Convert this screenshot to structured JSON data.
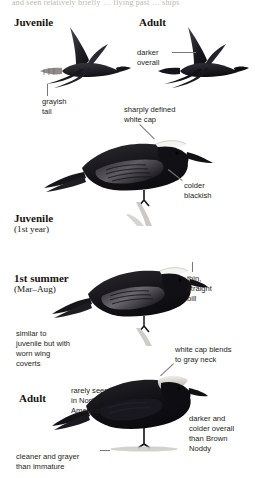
{
  "page": {
    "width": 255,
    "height": 478,
    "background": "#ffffff",
    "running_head_fragment": "and seen relatively briefly … flying past … ships"
  },
  "plate_labels": [
    {
      "id": "juvenile-flight",
      "text": "Juvenile",
      "sub": "",
      "x": 14,
      "y": 16,
      "size": 11
    },
    {
      "id": "adult-flight",
      "text": "Adult",
      "sub": "",
      "x": 139,
      "y": 16,
      "size": 11
    },
    {
      "id": "juvenile-perched",
      "text": "Juvenile",
      "sub": "(1st year)",
      "x": 14,
      "y": 212,
      "size": 11
    },
    {
      "id": "first-summer",
      "text": "1st summer",
      "sub": "(Mar–Aug)",
      "x": 14,
      "y": 272,
      "size": 11
    },
    {
      "id": "adult-perched",
      "text": "Adult",
      "sub": "",
      "x": 19,
      "y": 392,
      "size": 11
    }
  ],
  "annotations": [
    {
      "id": "darker-overall",
      "lines": [
        "darker",
        "overall"
      ],
      "x": 137,
      "y": 48
    },
    {
      "id": "grayish-tail",
      "lines": [
        "grayish",
        "tail"
      ],
      "x": 42,
      "y": 97
    },
    {
      "id": "sharply-defined-white-cap",
      "lines": [
        "sharply defined",
        "white cap"
      ],
      "x": 124,
      "y": 105
    },
    {
      "id": "colder-blackish",
      "lines": [
        "colder",
        "blackish"
      ],
      "x": 184,
      "y": 181
    },
    {
      "id": "thin-straight-bill",
      "lines": [
        "thin,",
        "straight",
        "bill"
      ],
      "x": 187,
      "y": 274
    },
    {
      "id": "similar-to-juvenile",
      "lines": [
        "similar to",
        "juvenile but with",
        "worn wing",
        "coverts"
      ],
      "x": 16,
      "y": 329
    },
    {
      "id": "white-cap-blends",
      "lines": [
        "white cap blends",
        "to gray neck"
      ],
      "x": 175,
      "y": 345
    },
    {
      "id": "rarely-seen",
      "lines": [
        "rarely seen",
        "in North",
        "America"
      ],
      "x": 71,
      "y": 386
    },
    {
      "id": "darker-and-colder",
      "lines": [
        "darker and",
        "colder overall",
        "than Brown",
        "Noddy"
      ],
      "x": 189,
      "y": 414
    },
    {
      "id": "cleaner-and-grayer",
      "lines": [
        "cleaner and grayer",
        "than immature"
      ],
      "x": 16,
      "y": 452
    }
  ],
  "leaders": [
    {
      "id": "leader-darker-overall",
      "x1": 172,
      "y1": 52,
      "x2": 196,
      "y2": 52
    },
    {
      "id": "leader-grayish-tail",
      "x1": 47,
      "y1": 96,
      "x2": 47,
      "y2": 84
    },
    {
      "id": "leader-white-cap",
      "x1": 140,
      "y1": 124,
      "x2": 155,
      "y2": 139
    },
    {
      "id": "leader-colder-blackish",
      "x1": 182,
      "y1": 181,
      "x2": 168,
      "y2": 170
    },
    {
      "id": "leader-thin-bill",
      "x1": 192,
      "y1": 272,
      "x2": 192,
      "y2": 262
    },
    {
      "id": "leader-white-cap-blends",
      "x1": 174,
      "y1": 364,
      "x2": 161,
      "y2": 376
    },
    {
      "id": "leader-cleaner-grayer",
      "x1": 100,
      "y1": 450,
      "x2": 110,
      "y2": 450
    }
  ],
  "figures": [
    {
      "id": "juvenile-in-flight",
      "name": "juvenile-noddy-flight-illustration",
      "description": "Juvenile Black Noddy in flight, dark body with grayish tail",
      "x": 32,
      "y": 22,
      "width": 100,
      "height": 66
    },
    {
      "id": "adult-in-flight",
      "name": "adult-noddy-flight-illustration",
      "description": "Adult Black Noddy in flight, uniformly dark",
      "x": 150,
      "y": 22,
      "width": 100,
      "height": 66
    },
    {
      "id": "juvenile-perched",
      "name": "juvenile-noddy-perched-illustration",
      "description": "Juvenile Black Noddy perched on a branch, sharply defined white cap",
      "x": 40,
      "y": 120,
      "width": 170,
      "height": 100
    },
    {
      "id": "first-summer-perched",
      "name": "first-summer-noddy-perched-illustration",
      "description": "First summer Black Noddy perched, worn wing coverts",
      "x": 52,
      "y": 250,
      "width": 150,
      "height": 92
    },
    {
      "id": "adult-perched",
      "name": "adult-noddy-perched-illustration",
      "description": "Adult Black Noddy perched, white cap blending to gray neck",
      "x": 52,
      "y": 358,
      "width": 150,
      "height": 100
    }
  ],
  "colors": {
    "body_dark": "#151417",
    "body_mid": "#2e2c30",
    "wing_gray": "#6b6a70",
    "cap_white": "#f4f3ef",
    "neck_gray": "#a9a6a2",
    "tail_gray": "#8e8b88",
    "leader": "#7d7772",
    "text": "#231d18",
    "label_text": "#18120e",
    "running_head": "#bdb7b1",
    "background": "#ffffff"
  }
}
